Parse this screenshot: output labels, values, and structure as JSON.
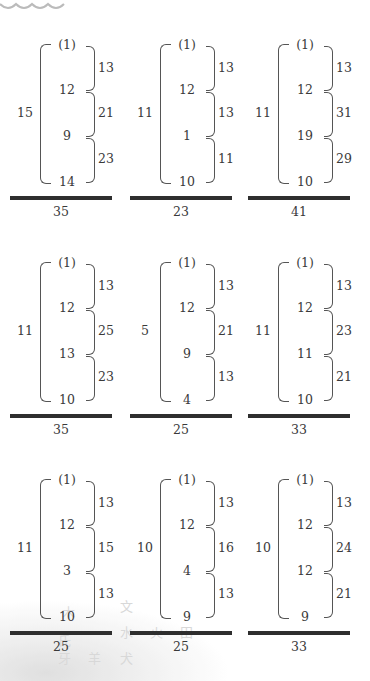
{
  "panels": [
    {
      "left": "15",
      "values": [
        "(1)",
        "12",
        "9",
        "14"
      ],
      "right": [
        "13",
        "21",
        "23"
      ],
      "total": "35"
    },
    {
      "left": "11",
      "values": [
        "(1)",
        "12",
        "1",
        "10"
      ],
      "right": [
        "13",
        "13",
        "11"
      ],
      "total": "23"
    },
    {
      "left": "11",
      "values": [
        "(1)",
        "12",
        "19",
        "10"
      ],
      "right": [
        "13",
        "31",
        "29"
      ],
      "total": "41"
    },
    {
      "left": "11",
      "values": [
        "(1)",
        "12",
        "13",
        "10"
      ],
      "right": [
        "13",
        "25",
        "23"
      ],
      "total": "35"
    },
    {
      "left": "5",
      "values": [
        "(1)",
        "12",
        "9",
        "4"
      ],
      "right": [
        "13",
        "21",
        "13"
      ],
      "total": "25"
    },
    {
      "left": "11",
      "values": [
        "(1)",
        "12",
        "11",
        "10"
      ],
      "right": [
        "13",
        "23",
        "21"
      ],
      "total": "33"
    },
    {
      "left": "11",
      "values": [
        "(1)",
        "12",
        "3",
        "10"
      ],
      "right": [
        "13",
        "15",
        "13"
      ],
      "total": "25"
    },
    {
      "left": "10",
      "values": [
        "(1)",
        "12",
        "4",
        "9"
      ],
      "right": [
        "13",
        "16",
        "13"
      ],
      "total": "25"
    },
    {
      "left": "10",
      "values": [
        "(1)",
        "12",
        "12",
        "9"
      ],
      "right": [
        "13",
        "24",
        "21"
      ],
      "total": "33"
    }
  ],
  "watermark_glyphs": [
    "文",
    "水",
    "犬",
    "氏",
    "牙",
    "羊",
    "大",
    "木",
    "火",
    "田"
  ],
  "colors": {
    "ink": "#3a3a3a",
    "bar": "#2e2e2e",
    "bracket": "#555555"
  }
}
